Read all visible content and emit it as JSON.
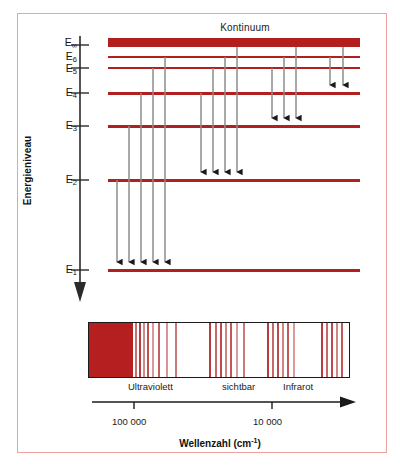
{
  "figure": {
    "title": "Kontinuum",
    "y_axis_label": "Energieniveau",
    "x_axis_caption_main": "Wellenzahl (cm",
    "x_axis_caption_sup": "-1",
    "x_axis_caption_tail": ")",
    "frame_color": "#efa0a0",
    "level_color": "#b11f1f",
    "arrow_color": "#1a1a1a",
    "spectrum_block_color": "#b51f1f"
  },
  "levels": [
    {
      "id": "E_inf",
      "label": "E",
      "sub": "∞",
      "y": 42,
      "thickness": 8,
      "tick_y": 45
    },
    {
      "id": "E6",
      "label": "E",
      "sub": "6",
      "y": 57,
      "thickness": 2,
      "tick_y": 57
    },
    {
      "id": "E5",
      "label": "E",
      "sub": "5",
      "y": 68,
      "thickness": 2,
      "tick_y": 68
    },
    {
      "id": "E4",
      "label": "E",
      "sub": "4",
      "y": 93,
      "thickness": 3,
      "tick_y": 93
    },
    {
      "id": "E3",
      "label": "E",
      "sub": "3",
      "y": 126,
      "thickness": 3,
      "tick_y": 126
    },
    {
      "id": "E2",
      "label": "E",
      "sub": "2",
      "y": 180,
      "thickness": 3,
      "tick_y": 180
    },
    {
      "id": "E1",
      "label": "E",
      "sub": "1",
      "y": 270,
      "thickness": 3,
      "tick_y": 270
    }
  ],
  "transitions": {
    "to_E4": {
      "count": 2,
      "target_y": 93,
      "xs": [
        330,
        343
      ],
      "from_ys": [
        57,
        68
      ]
    },
    "to_E3": {
      "count": 3,
      "target_y": 126,
      "xs": [
        272,
        284,
        296
      ],
      "from_ys": [
        57,
        68,
        42
      ]
    },
    "to_E2": {
      "count": 4,
      "target_y": 180,
      "xs": [
        201,
        213,
        225,
        237
      ],
      "from_ys": [
        57,
        68,
        42,
        93
      ]
    },
    "to_E1": {
      "count": 5,
      "target_y": 270,
      "xs": [
        117,
        129,
        141,
        153,
        165
      ],
      "from_ys": [
        57,
        68,
        42,
        93,
        126
      ]
    }
  },
  "spectrum": {
    "block_width_px": 44,
    "lines": [
      {
        "x": 46,
        "w": 1.5,
        "c": "#c87070"
      },
      {
        "x": 50,
        "w": 2,
        "c": "#b93a3a"
      },
      {
        "x": 54,
        "w": 1.5,
        "c": "#cf8a8a"
      },
      {
        "x": 58,
        "w": 2,
        "c": "#c05050"
      },
      {
        "x": 63,
        "w": 1.5,
        "c": "#d89a9a"
      },
      {
        "x": 69,
        "w": 2,
        "c": "#c46060"
      },
      {
        "x": 77,
        "w": 1.5,
        "c": "#d79595"
      },
      {
        "x": 86,
        "w": 2,
        "c": "#cb7878"
      },
      {
        "x": 120,
        "w": 2,
        "c": "#b93a3a"
      },
      {
        "x": 126,
        "w": 1.5,
        "c": "#c66868"
      },
      {
        "x": 131,
        "w": 2,
        "c": "#bd4a4a"
      },
      {
        "x": 136,
        "w": 1.5,
        "c": "#d08585"
      },
      {
        "x": 141,
        "w": 2,
        "c": "#c25858"
      },
      {
        "x": 147,
        "w": 1.5,
        "c": "#d89a9a"
      },
      {
        "x": 154,
        "w": 2,
        "c": "#cb7878"
      },
      {
        "x": 178,
        "w": 2,
        "c": "#b93a3a"
      },
      {
        "x": 183,
        "w": 1.5,
        "c": "#c66868"
      },
      {
        "x": 188,
        "w": 2,
        "c": "#bd4a4a"
      },
      {
        "x": 193,
        "w": 1.5,
        "c": "#d08585"
      },
      {
        "x": 198,
        "w": 2,
        "c": "#c25858"
      },
      {
        "x": 204,
        "w": 1.5,
        "c": "#d89a9a"
      },
      {
        "x": 232,
        "w": 2,
        "c": "#b93a3a"
      },
      {
        "x": 237,
        "w": 1.5,
        "c": "#c66868"
      },
      {
        "x": 242,
        "w": 2,
        "c": "#bd4a4a"
      },
      {
        "x": 247,
        "w": 1.5,
        "c": "#d08585"
      },
      {
        "x": 252,
        "w": 2,
        "c": "#c25858"
      }
    ],
    "regions": [
      {
        "name": "ultraviolett",
        "label": "Ultraviolett",
        "x": 128
      },
      {
        "name": "sichtbar",
        "label": "sichtbar",
        "x": 222
      },
      {
        "name": "infrarot",
        "label": "Infrarot",
        "x": 283
      }
    ],
    "axis_ticks": [
      {
        "label": "100 000",
        "x": 130
      },
      {
        "label": "10 000",
        "x": 267
      }
    ]
  },
  "chart_data": {
    "type": "diagram",
    "title": "Kontinuum",
    "ylabel": "Energieniveau",
    "xlabel": "Wellenzahl (cm-1)",
    "levels": [
      "E1",
      "E2",
      "E3",
      "E4",
      "E5",
      "E6",
      "E∞"
    ],
    "transition_groups": [
      {
        "terminates_at": "E4",
        "arrows": 2
      },
      {
        "terminates_at": "E3",
        "arrows": 3
      },
      {
        "terminates_at": "E2",
        "arrows": 4
      },
      {
        "terminates_at": "E1",
        "arrows": 5
      }
    ],
    "spectral_regions": [
      "Ultraviolett",
      "sichtbar",
      "Infrarot"
    ],
    "xtick_labels": [
      "100 000",
      "10 000"
    ],
    "xaxis_direction": "decreasing wavenumber to the right",
    "continuum_band": "solid red band at E∞"
  }
}
